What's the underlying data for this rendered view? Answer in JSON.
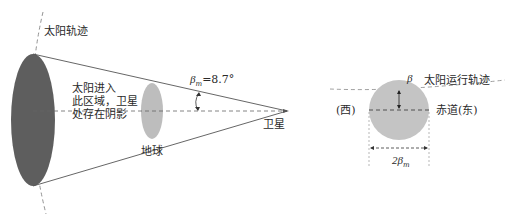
{
  "left_diagram": {
    "sun_orbit_label": "太阳轨迹",
    "shadow_region_label": [
      "太阳进入",
      "此区域，卫星",
      "处存在阴影"
    ],
    "earth_label": "地球",
    "satellite_label": "卫星",
    "angle_label": {
      "symbol": "β",
      "subscript": "m",
      "value": "=8.7°"
    },
    "colors": {
      "sun_disc": "#5e5e5e",
      "earth_disc": "#bdbdbd",
      "lines": "#555555"
    }
  },
  "right_diagram": {
    "beta_label": "β",
    "sun_path_label": "太阳运行轨迹",
    "west_label": "(西)",
    "equator_label": "赤道(东)",
    "width_label": {
      "prefix": "2β",
      "subscript": "m"
    },
    "colors": {
      "earth_disc": "#c4c4c4"
    }
  }
}
